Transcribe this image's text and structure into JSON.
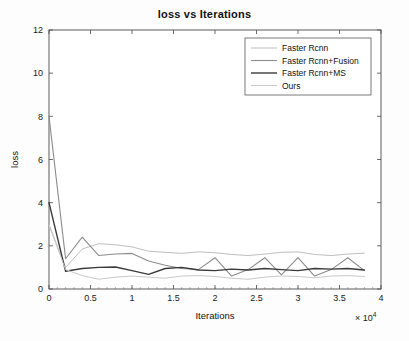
{
  "chart_data": {
    "type": "line",
    "title": "loss vs Iterations",
    "xlabel": "Iterations",
    "ylabel": "loss",
    "x_exponent_label": "× 10",
    "x_exponent_power": "4",
    "xlim": [
      0,
      4
    ],
    "ylim": [
      0,
      12
    ],
    "xticks": [
      0,
      0.5,
      1,
      1.5,
      2,
      2.5,
      3,
      3.5,
      4
    ],
    "xticklabels": [
      "0",
      "0.5",
      "1",
      "1.5",
      "2",
      "2.5",
      "3",
      "3.5",
      "4"
    ],
    "yticks": [
      0,
      2,
      4,
      6,
      8,
      10,
      12
    ],
    "yticklabels": [
      "0",
      "2",
      "4",
      "6",
      "8",
      "10",
      "12"
    ],
    "grid": false,
    "legend_position": "upper right",
    "x": [
      0,
      0.2,
      0.4,
      0.6,
      0.8,
      1.0,
      1.2,
      1.4,
      1.6,
      1.8,
      2.0,
      2.2,
      2.4,
      2.6,
      2.8,
      3.0,
      3.2,
      3.4,
      3.6,
      3.8
    ],
    "series": [
      {
        "name": "Faster Rcnn",
        "color": "#bfbfbf",
        "width": 1.0,
        "values": [
          3.0,
          1.0,
          1.85,
          2.1,
          2.05,
          1.95,
          1.75,
          1.7,
          1.65,
          1.72,
          1.68,
          1.6,
          1.55,
          1.62,
          1.7,
          1.72,
          1.6,
          1.55,
          1.62,
          1.66
        ]
      },
      {
        "name": "Faster Rcnn+Fusion",
        "color": "#8c8c8c",
        "width": 1.1,
        "values": [
          8.0,
          1.4,
          2.4,
          1.55,
          1.62,
          1.65,
          1.3,
          1.1,
          0.95,
          0.9,
          1.45,
          0.6,
          0.9,
          1.45,
          0.65,
          1.45,
          0.6,
          0.9,
          1.45,
          0.85
        ]
      },
      {
        "name": "Faster Rcnn+MS",
        "color": "#3a3a3a",
        "width": 1.4,
        "values": [
          4.0,
          0.82,
          0.95,
          1.0,
          1.02,
          0.85,
          0.68,
          0.95,
          1.0,
          0.88,
          0.85,
          0.92,
          0.88,
          0.95,
          0.9,
          0.85,
          0.95,
          0.92,
          0.95,
          0.88
        ]
      },
      {
        "name": "Ours",
        "color": "#c9c9c9",
        "width": 1.0,
        "values": [
          2.95,
          0.9,
          0.62,
          0.45,
          0.55,
          0.6,
          0.55,
          0.5,
          0.6,
          0.62,
          0.58,
          0.5,
          0.45,
          0.55,
          0.6,
          0.58,
          0.52,
          0.6,
          0.62,
          0.58
        ]
      }
    ]
  },
  "legend": {
    "items": [
      {
        "label": "Faster Rcnn"
      },
      {
        "label": "Faster Rcnn+Fusion"
      },
      {
        "label": "Faster Rcnn+MS"
      },
      {
        "label": "Ours"
      }
    ]
  }
}
